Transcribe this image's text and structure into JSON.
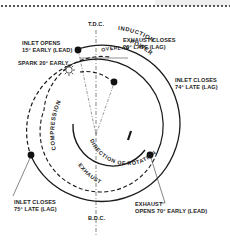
{
  "diagram": {
    "markers": {
      "tdc": "T.D.C.",
      "bdc": "B.D.C."
    },
    "events": [
      {
        "line1": "INLET OPENS",
        "line2": "15° EARLY (LEAD)"
      },
      {
        "line1": "EXHAUST CLOSES",
        "line2": "20° LATE (LAG)"
      },
      {
        "line1": "SPARK 20° EARLY",
        "line2": ""
      },
      {
        "line1": "INLET CLOSES",
        "line2": "74° LATE (LAG)"
      },
      {
        "line1": "INLET CLOSES",
        "line2": "75° LATE (LAG)"
      },
      {
        "line1": "EXHAUST",
        "line2": "OPENS 70° EARLY (LEAD)"
      }
    ],
    "strokes": {
      "induction": "INDUCTION",
      "power": "POWER",
      "compression": "COMPRESSION",
      "exhaust": "EXHAUST",
      "overlap": "OVERLAP"
    },
    "rotation_label": "DIRECTION OF ROTATION",
    "colors": {
      "line": "#1a1a1a",
      "text": "#222222",
      "background": "#ffffff"
    }
  }
}
